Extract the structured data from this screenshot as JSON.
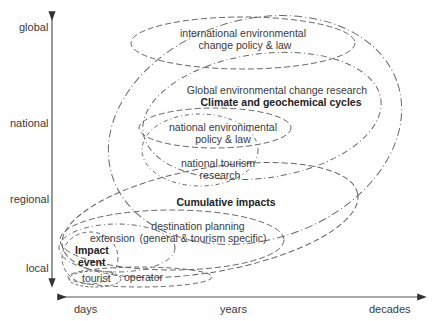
{
  "diagram": {
    "y_axis": {
      "labels": [
        "global",
        "national",
        "regional",
        "local"
      ],
      "direction": "bidirectional"
    },
    "x_axis": {
      "labels": [
        "days",
        "years",
        "decades"
      ],
      "direction": "bidirectional"
    },
    "ellipses": {
      "international": {
        "line1": "international environmental",
        "line2": "change policy & law"
      },
      "global": {
        "line1": "Global environmental change research",
        "line2": "Climate and geochemical cycles"
      },
      "national_policy": {
        "line1": "national environimental",
        "line2": "policy & law"
      },
      "national_tourism": {
        "line1": "national tourism",
        "line2": "research"
      },
      "cumulative": {
        "label": "Cumulative impacts"
      },
      "destination": {
        "line1": "destination planning",
        "line2": "(general & tourism specific)"
      },
      "extension": {
        "label": "extension"
      },
      "impact": {
        "line1": "Impact",
        "line2": "event"
      },
      "tourist": {
        "label": "tourist"
      },
      "operator": {
        "label": "operator"
      }
    },
    "colors": {
      "line": "#555555",
      "text": "#333333"
    }
  }
}
